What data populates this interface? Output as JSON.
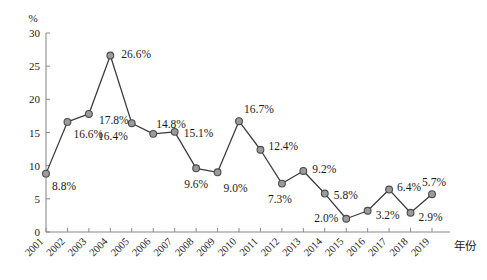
{
  "chart_data": {
    "type": "line",
    "title": "",
    "xlabel": "年份",
    "ylabel": "%",
    "ylim": [
      0,
      30
    ],
    "yticks": [
      0,
      5,
      10,
      15,
      20,
      25,
      30
    ],
    "ytick_labels": [
      "0",
      "5",
      "10",
      "15",
      "20",
      "25",
      "30"
    ],
    "grid": false,
    "legend": "none",
    "categories": [
      "2001",
      "2002",
      "2003",
      "2004",
      "2005",
      "2006",
      "2007",
      "2008",
      "2009",
      "2010",
      "2011",
      "2012",
      "2013",
      "2014",
      "2015",
      "2016",
      "2017",
      "2018",
      "2019"
    ],
    "values": [
      8.8,
      16.6,
      17.8,
      26.6,
      16.4,
      14.8,
      15.1,
      9.6,
      9.0,
      16.7,
      12.4,
      7.3,
      9.2,
      5.8,
      2.0,
      3.2,
      6.4,
      2.9,
      5.7
    ],
    "data_labels": [
      "8.8%",
      "16.6%",
      "17.8%",
      "26.6%",
      "16.4%",
      "14.8%",
      "15.1%",
      "9.6%",
      "9.0%",
      "16.7%",
      "12.4%",
      "7.3%",
      "9.2%",
      "5.8%",
      "2.0%",
      "3.2%",
      "6.4%",
      "2.9%",
      "5.7%"
    ],
    "label_offsets": [
      {
        "dx": 6,
        "dy": 16,
        "anchor": "start"
      },
      {
        "dx": 6,
        "dy": 16,
        "anchor": "start"
      },
      {
        "dx": 10,
        "dy": 10,
        "anchor": "start"
      },
      {
        "dx": 11,
        "dy": 2,
        "anchor": "start"
      },
      {
        "dx": -4,
        "dy": 17,
        "anchor": "end"
      },
      {
        "dx": 3,
        "dy": -6,
        "anchor": "start"
      },
      {
        "dx": 9,
        "dy": 5,
        "anchor": "start"
      },
      {
        "dx": 0,
        "dy": 20,
        "anchor": "middle"
      },
      {
        "dx": 6,
        "dy": 20,
        "anchor": "start"
      },
      {
        "dx": 5,
        "dy": -8,
        "anchor": "start"
      },
      {
        "dx": 8,
        "dy": 0,
        "anchor": "start"
      },
      {
        "dx": -2,
        "dy": 19,
        "anchor": "middle"
      },
      {
        "dx": 9,
        "dy": 2,
        "anchor": "start"
      },
      {
        "dx": 9,
        "dy": 5,
        "anchor": "start"
      },
      {
        "dx": -8,
        "dy": 3,
        "anchor": "end"
      },
      {
        "dx": 8,
        "dy": 8,
        "anchor": "start"
      },
      {
        "dx": 8,
        "dy": 1,
        "anchor": "start"
      },
      {
        "dx": 8,
        "dy": 8,
        "anchor": "start"
      },
      {
        "dx": 2,
        "dy": -8,
        "anchor": "middle"
      }
    ],
    "colors": {
      "line": "#3a3a3a",
      "marker_fill": "#9b9b9b",
      "marker_stroke": "#4a4a4a",
      "axis": "#8a8a8a",
      "text": "#1a1a1a",
      "background": "#ffffff"
    }
  }
}
